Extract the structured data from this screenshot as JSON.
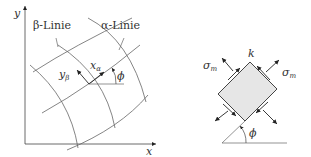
{
  "left_diagram": {
    "axis_x_label": "x",
    "axis_y_label": "y",
    "beta_line_label": "β-Linie",
    "alpha_line_label": "α-Linie",
    "x_alpha_label": "x",
    "x_alpha_sub": "α",
    "y_beta_label": "y",
    "y_beta_sub": "β",
    "angle_label": "ϕ"
  },
  "right_diagram": {
    "point_label": "k",
    "stress_left_label": "σ",
    "stress_left_sub": "m",
    "stress_right_label": "σ",
    "stress_right_sub": "m",
    "angle_label": "ϕ",
    "element_fill": "#e6e6e6"
  },
  "colors": {
    "line": "#555555",
    "text": "#333333"
  }
}
